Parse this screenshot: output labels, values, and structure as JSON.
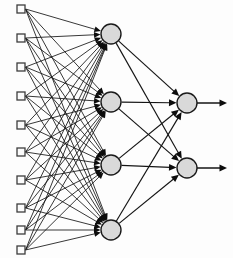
{
  "figure": {
    "background_color": "#fdfdfd",
    "width": 233,
    "height": 258
  },
  "style": {
    "edge_color": "#141414",
    "input_node_fill": "#fbfbfb",
    "input_node_stroke": "#3d3d3d",
    "neuron_fill": "#d9d9d9",
    "neuron_stroke": "#1a1a1a",
    "arrow_head_color": "#0d0d0d"
  },
  "network": {
    "type": "fully-connected-feedforward",
    "layer_count": 3,
    "layers": [
      {
        "name": "input-layer",
        "node_shape": "square",
        "node_count": 9,
        "node_size": 8,
        "x": 21,
        "nodes": [
          {
            "id": "i1",
            "cx": 21,
            "cy": 9
          },
          {
            "id": "i2",
            "cx": 21,
            "cy": 38
          },
          {
            "id": "i3",
            "cx": 21,
            "cy": 67
          },
          {
            "id": "i4",
            "cx": 21,
            "cy": 96
          },
          {
            "id": "i5",
            "cx": 21,
            "cy": 125
          },
          {
            "id": "i6",
            "cx": 21,
            "cy": 152
          },
          {
            "id": "i7",
            "cx": 21,
            "cy": 180
          },
          {
            "id": "i8",
            "cx": 21,
            "cy": 208
          },
          {
            "id": "i9",
            "cx": 21,
            "cy": 230
          },
          {
            "id": "i10",
            "cx": 21,
            "cy": 250
          }
        ]
      },
      {
        "name": "hidden-layer",
        "node_shape": "circle",
        "node_count": 4,
        "node_radius": 10,
        "x": 111,
        "nodes": [
          {
            "id": "h1",
            "cx": 111,
            "cy": 34
          },
          {
            "id": "h2",
            "cx": 111,
            "cy": 102
          },
          {
            "id": "h3",
            "cx": 111,
            "cy": 165
          },
          {
            "id": "h4",
            "cx": 111,
            "cy": 230
          }
        ]
      },
      {
        "name": "output-layer",
        "node_shape": "circle",
        "node_count": 2,
        "node_radius": 10,
        "x": 187,
        "nodes": [
          {
            "id": "o1",
            "cx": 187,
            "cy": 103
          },
          {
            "id": "o2",
            "cx": 187,
            "cy": 168
          }
        ]
      }
    ],
    "output_arrow_end_x": 227,
    "connections": {
      "input_to_hidden": "all-to-all",
      "hidden_to_output": "all-to-all",
      "input_to_hidden_count": 40,
      "hidden_to_output_count": 8,
      "output_terminal_arrows": 2
    }
  }
}
